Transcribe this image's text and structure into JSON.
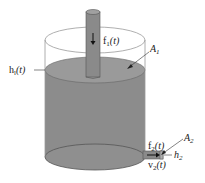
{
  "diagram": {
    "colors": {
      "liquid": "#8c8c8c",
      "liquid_surface": "#9a9a9a",
      "pipe": "#8a8a8a",
      "outline": "#555555",
      "glass_edge": "#9a9a9a",
      "text": "#222222"
    },
    "labels": {
      "inflow": {
        "base": "f",
        "sub": "1",
        "arg": "(t)"
      },
      "area_top": {
        "base": "A",
        "sub": "1"
      },
      "level": {
        "base": "h",
        "sub": "l",
        "arg": "(t)"
      },
      "outflow": {
        "base": "f",
        "sub": "2",
        "arg": "(t)"
      },
      "area_outlet": {
        "base": "A",
        "sub": "2"
      },
      "outlet_height": {
        "base": "h",
        "sub": "2"
      },
      "outlet_velocity": {
        "base": "v",
        "sub": "2",
        "arg": "(t)"
      }
    }
  }
}
